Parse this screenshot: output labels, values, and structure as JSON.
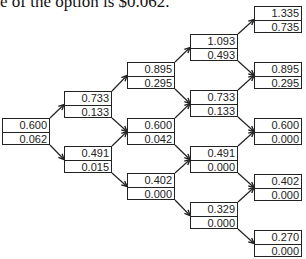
{
  "caption": "e of the option is $0.062.",
  "tree": {
    "columns": [
      {
        "x": 2,
        "nodes": [
          {
            "y": 118,
            "price": "0.600",
            "option": "0.062"
          }
        ]
      },
      {
        "x": 64,
        "nodes": [
          {
            "y": 91,
            "price": "0.733",
            "option": "0.133"
          },
          {
            "y": 146,
            "price": "0.491",
            "option": "0.015"
          }
        ]
      },
      {
        "x": 127,
        "nodes": [
          {
            "y": 62,
            "price": "0.895",
            "option": "0.295"
          },
          {
            "y": 118,
            "price": "0.600",
            "option": "0.042"
          },
          {
            "y": 173,
            "price": "0.402",
            "option": "0.000"
          }
        ]
      },
      {
        "x": 190,
        "nodes": [
          {
            "y": 34,
            "price": "1.093",
            "option": "0.493"
          },
          {
            "y": 90,
            "price": "0.733",
            "option": "0.133"
          },
          {
            "y": 146,
            "price": "0.491",
            "option": "0.000"
          },
          {
            "y": 202,
            "price": "0.329",
            "option": "0.000"
          }
        ]
      },
      {
        "x": 254,
        "nodes": [
          {
            "y": 6,
            "price": "1.335",
            "option": "0.735"
          },
          {
            "y": 62,
            "price": "0.895",
            "option": "0.295"
          },
          {
            "y": 118,
            "price": "0.600",
            "option": "0.000"
          },
          {
            "y": 174,
            "price": "0.402",
            "option": "0.000"
          },
          {
            "y": 230,
            "price": "0.270",
            "option": "0.000"
          }
        ]
      }
    ]
  }
}
